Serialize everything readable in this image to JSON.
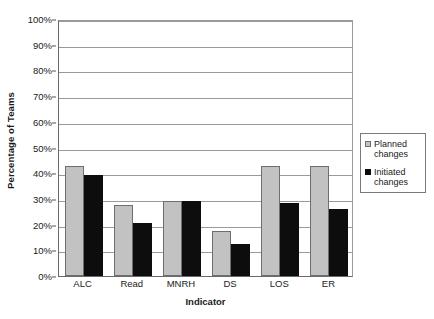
{
  "chart_data": {
    "type": "bar",
    "title": "",
    "xlabel": "Indicator",
    "ylabel": "Percentage of Teams",
    "categories": [
      "ALC",
      "Read",
      "MNRH",
      "DS",
      "LOS",
      "ER"
    ],
    "series": [
      {
        "name": "Planned changes",
        "color": "#c2c2c2",
        "values": [
          43,
          27.5,
          29,
          17.5,
          43,
          43
        ]
      },
      {
        "name": "Initiated changes",
        "color": "#0d0d0d",
        "values": [
          39.5,
          20.5,
          29,
          12.5,
          28.5,
          26
        ]
      }
    ],
    "ylim": [
      0,
      100
    ],
    "ytick_values": [
      0,
      10,
      20,
      30,
      40,
      50,
      60,
      70,
      80,
      90,
      100
    ],
    "ytick_labels": [
      "0%",
      "10%",
      "20%",
      "30%",
      "40%",
      "50%",
      "60%",
      "70%",
      "80%",
      "90%",
      "100%"
    ],
    "grid": true,
    "legend_position": "right"
  },
  "legend": {
    "entries": [
      {
        "label_line1": "Planned",
        "label_line2": "changes",
        "swatch": "planned-swatch"
      },
      {
        "label_line1": "Initiated",
        "label_line2": "changes",
        "swatch": "initiated-swatch"
      }
    ]
  }
}
